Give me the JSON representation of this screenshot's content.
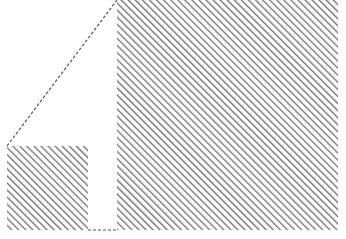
{
  "diagram": {
    "colors": {
      "background": "#ffffff",
      "hatch_stroke": "#6e6e6e",
      "dash_stroke": "#555555"
    },
    "shapes": [
      {
        "id": "large-block",
        "x": 117,
        "y": 0,
        "width": 221,
        "height": 230
      },
      {
        "id": "small-block",
        "x": 7,
        "y": 146,
        "width": 81,
        "height": 84
      }
    ],
    "dashed_edges": [
      {
        "id": "diagonal-edge",
        "x1": 7,
        "y1": 146,
        "x2": 117,
        "y2": 0
      },
      {
        "id": "bottom-gap-edge",
        "x1": 88,
        "y1": 230,
        "x2": 117,
        "y2": 230
      }
    ]
  }
}
